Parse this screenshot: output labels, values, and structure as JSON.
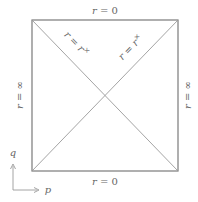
{
  "diagram": {
    "type": "penrose-diagram",
    "colors": {
      "frame": "#7a7a7a",
      "diagonal": "#9a9a9a",
      "text": "#666666",
      "background": "#ffffff"
    },
    "labels": {
      "top": {
        "var": "r",
        "eq": " = ",
        "val": "0"
      },
      "bottom": {
        "var": "r",
        "eq": " = ",
        "val": "0"
      },
      "left": {
        "var": "r",
        "eq": " = ",
        "val": "∞"
      },
      "right": {
        "var": "r",
        "eq": " = ",
        "val": "∞"
      },
      "diag_left": {
        "var": "r",
        "eq": " = ",
        "rhs": "r",
        "sup": "×"
      },
      "diag_right": {
        "var": "r",
        "eq": " = ",
        "rhs": "r",
        "sup": "×"
      }
    },
    "axes": {
      "vertical": "q",
      "horizontal": "p"
    }
  }
}
